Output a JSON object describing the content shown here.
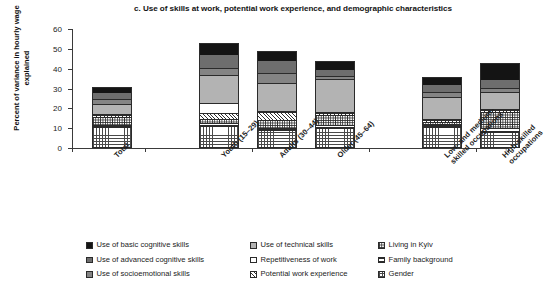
{
  "chart_data": {
    "type": "bar",
    "subtype": "stacked-bar",
    "title": "c. Use of skills at work, potential work experience, and demographic characteristics",
    "xlabel": "",
    "ylabel": "Percent of variance in hourly wage explained",
    "ylim": [
      0,
      60
    ],
    "yticks": [
      0,
      10,
      20,
      30,
      40,
      50,
      60
    ],
    "grid": false,
    "legend_position": "bottom",
    "categories": [
      "Total",
      "Youth (15–29)",
      "Adults (30–44)",
      "Older (45–64)",
      "Low- and medium-\nskilled occupations",
      "High-skilled\noccupations"
    ],
    "series": [
      {
        "name": "Gender",
        "pattern": "grid",
        "values": [
          10.5,
          11.0,
          9.0,
          10.0,
          10.5,
          8.0
        ]
      },
      {
        "name": "Family background",
        "pattern": "hlines",
        "values": [
          1.2,
          1.6,
          1.2,
          1.5,
          1.0,
          2.2
        ]
      },
      {
        "name": "Living in Kyiv",
        "pattern": "check",
        "values": [
          4.0,
          2.0,
          4.0,
          5.0,
          1.5,
          8.0
        ]
      },
      {
        "name": "Potential work experience",
        "pattern": "diagonal",
        "values": [
          0.9,
          3.2,
          3.8,
          1.0,
          1.0,
          1.0
        ]
      },
      {
        "name": "Repetitiveness of work",
        "pattern": "white",
        "values": [
          0.4,
          5.0,
          0.5,
          0.6,
          0.4,
          0.5
        ]
      },
      {
        "name": "Use of technical skills",
        "pattern": "light-gray",
        "values": [
          5.2,
          14.0,
          14.2,
          16.6,
          11.3,
          8.5
        ]
      },
      {
        "name": "Use of socioemotional skills",
        "pattern": "mid-gray",
        "values": [
          2.6,
          3.6,
          5.2,
          1.5,
          2.6,
          1.8
        ]
      },
      {
        "name": "Use of advanced cognitive skills",
        "pattern": "dark-gray",
        "values": [
          3.4,
          7.0,
          6.6,
          3.5,
          4.0,
          5.0
        ]
      },
      {
        "name": "Use of basic cognitive skills",
        "pattern": "black",
        "values": [
          2.8,
          5.6,
          4.5,
          4.3,
          3.7,
          8.0
        ]
      }
    ],
    "totals": [
      31.0,
      53.0,
      49.0,
      44.0,
      36.0,
      43.0
    ]
  },
  "legend": {
    "columns": [
      {
        "items": [
          {
            "label": "Use of basic cognitive skills",
            "swatch": "black"
          },
          {
            "label": "Use of advanced cognitive skills",
            "swatch": "dark-gray"
          },
          {
            "label": "Use of socioemotional skills",
            "swatch": "mid-gray"
          }
        ]
      },
      {
        "items": [
          {
            "label": "Use of technical skills",
            "swatch": "light-gray"
          },
          {
            "label": "Repetitiveness of work",
            "swatch": "white"
          },
          {
            "label": "Potential work experience",
            "swatch": "diagonal"
          }
        ]
      },
      {
        "items": [
          {
            "label": "Living in Kyiv",
            "swatch": "check"
          },
          {
            "label": "Family background",
            "swatch": "hlines"
          },
          {
            "label": "Gender",
            "swatch": "grid"
          }
        ]
      }
    ]
  },
  "colors": {
    "black": "#141414",
    "dark_gray": "#6e6e6e",
    "mid_gray": "#848484",
    "light_gray": "#b3b3b3",
    "white": "#ffffff",
    "axis": "#3a3a3a",
    "text": "#1b1b1b",
    "background": "#ffffff"
  }
}
